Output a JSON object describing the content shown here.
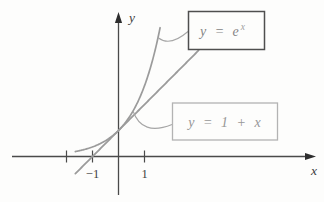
{
  "figure": {
    "background": "#fdfdfc",
    "colors": {
      "axis": "#4a4a4a",
      "curve": "#9b9b9b",
      "leader": "#a6a6a6",
      "exp_box_border": "#4f4f4f",
      "exp_box_text": "#858585",
      "line_box_border": "#b3b3b3",
      "line_box_text": "#979797"
    }
  },
  "chart_data": {
    "type": "line",
    "title": "",
    "xlabel": "x",
    "ylabel": "y",
    "xlim": [
      -4.1,
      7.6
    ],
    "ylim": [
      -1.55,
      5.55
    ],
    "grid": false,
    "legend": "none",
    "x_ticks": [
      {
        "value": -2,
        "label": ""
      },
      {
        "value": -1,
        "label": "−1"
      },
      {
        "value": 1,
        "label": "1"
      }
    ],
    "tangency_point": {
      "x": 0,
      "y": 1
    },
    "series": [
      {
        "name": "y = e^x",
        "formula": "exp(x)",
        "x_range": [
          -1.66,
          1.6
        ],
        "sample_points": {
          "x": [
            -1.5,
            -1,
            0,
            1,
            1.5
          ],
          "y": [
            0.22,
            0.37,
            1.0,
            2.72,
            4.48
          ]
        }
      },
      {
        "name": "y = 1 + x",
        "formula": "1 + x",
        "x_range": [
          -1.66,
          3.08
        ],
        "sample_points": {
          "x": [
            -1,
            0,
            1,
            3
          ],
          "y": [
            0,
            1,
            2,
            4
          ]
        }
      }
    ],
    "annotations": [
      {
        "series": "y = e^x",
        "prefix": "y = e",
        "sup": "x"
      },
      {
        "series": "y = 1 + x",
        "text": "y = 1 + x"
      }
    ]
  }
}
